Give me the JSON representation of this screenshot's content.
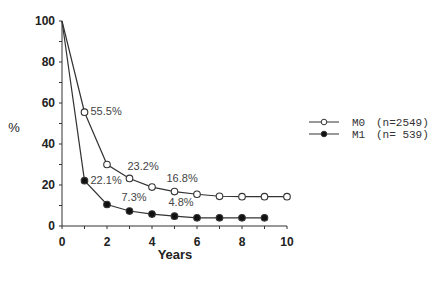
{
  "chart_data": {
    "type": "line",
    "title": "",
    "xlabel": "Years",
    "ylabel": "%",
    "xlim": [
      0,
      10
    ],
    "ylim": [
      0,
      100
    ],
    "xticks": [
      0,
      2,
      4,
      6,
      8,
      10
    ],
    "yticks": [
      0,
      20,
      40,
      60,
      80,
      100
    ],
    "grid": false,
    "legend_position": "right",
    "series": [
      {
        "name": "M0",
        "label": "M0   (n=2549)",
        "n": 2549,
        "marker": "open-circle",
        "x": [
          0,
          1,
          2,
          3,
          4,
          5,
          6,
          7,
          8,
          9,
          10
        ],
        "values": [
          100,
          55.5,
          30,
          23.2,
          19,
          16.8,
          15.5,
          14.5,
          14.3,
          14.3,
          14.3
        ]
      },
      {
        "name": "M1",
        "label": "M1   (n= 539)",
        "n": 539,
        "marker": "filled-circle",
        "x": [
          0,
          1,
          2,
          3,
          4,
          5,
          6,
          7,
          8,
          9
        ],
        "values": [
          100,
          22.1,
          10.5,
          7.3,
          5.8,
          4.8,
          4,
          4,
          4,
          4
        ]
      }
    ],
    "annotations": [
      {
        "series": "M0",
        "x": 1,
        "text": "55.5%"
      },
      {
        "series": "M0",
        "x": 3,
        "text": "23.2%"
      },
      {
        "series": "M0",
        "x": 5,
        "text": "16.8%"
      },
      {
        "series": "M1",
        "x": 1,
        "text": "22.1%"
      },
      {
        "series": "M1",
        "x": 3,
        "text": "7.3%"
      },
      {
        "series": "M1",
        "x": 5,
        "text": "4.8%"
      }
    ]
  },
  "legend": {
    "items": [
      {
        "name": "M0",
        "n_text": "(n=2549)"
      },
      {
        "name": "M1",
        "n_text": "(n= 539)"
      }
    ]
  },
  "axes": {
    "x_title": "Years",
    "y_title": "%"
  }
}
